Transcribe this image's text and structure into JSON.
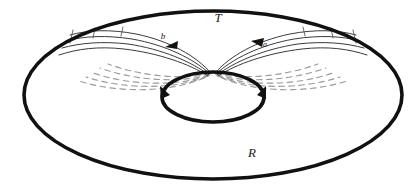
{
  "figure": {
    "title": "",
    "type": "topological-diagram",
    "canvas": {
      "width": 420,
      "height": 189,
      "background": "#ffffff"
    },
    "labels": [
      {
        "id": "T",
        "text": "T",
        "x": 218,
        "y": 22,
        "size": 13,
        "style": "italic"
      },
      {
        "id": "R",
        "text": "R",
        "x": 252,
        "y": 157,
        "size": 13,
        "style": "italic"
      },
      {
        "id": "a",
        "text": "a",
        "x": 265,
        "y": 47,
        "size": 8,
        "style": "italic"
      },
      {
        "id": "b",
        "text": "b",
        "x": 163,
        "y": 39,
        "size": 9,
        "style": "italic"
      }
    ],
    "shapes": {
      "outer_ellipse": {
        "name": "outer-boundary-ellipse",
        "cx": 213,
        "cy": 95,
        "rx": 189,
        "ry": 84,
        "stroke": "#111111",
        "stroke_width": 3.6,
        "fill": "none"
      },
      "inner_ellipse": {
        "name": "inner-hole-ellipse",
        "cx": 213,
        "cy": 97,
        "rx": 51,
        "ry": 25,
        "stroke": "#111111",
        "stroke_width": 3.6,
        "fill": "none"
      }
    },
    "colors": {
      "stroke_dark": "#111111",
      "stroke_thin": "#3a3a3a",
      "stroke_dashed": "#9a9a9a",
      "background": "#ffffff",
      "text": "#1a1a1a"
    },
    "convergence_point": {
      "x": 213,
      "y": 72
    },
    "arrow_markers": [
      {
        "id": "arrow-b",
        "x": 170,
        "y": 45,
        "direction": "left",
        "label": "b"
      },
      {
        "id": "arrow-a",
        "x": 258,
        "y": 43,
        "direction": "left",
        "label": "a"
      },
      {
        "id": "arrow-inner-left",
        "x": 164,
        "y": 93,
        "direction": "up"
      },
      {
        "id": "arrow-inner-right",
        "x": 263,
        "y": 92,
        "direction": "up"
      }
    ],
    "solid_curve_count": 8,
    "dashed_curve_count": 10
  }
}
